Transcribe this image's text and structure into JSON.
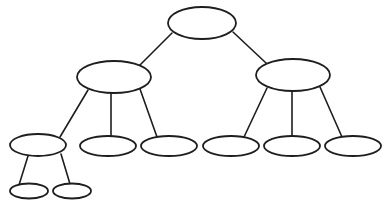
{
  "diagram": {
    "type": "tree",
    "title": "",
    "stroke_color": "#1e1e1e",
    "fill_color": "#ffffff",
    "background_color": "#ffffff",
    "nodes": [
      {
        "id": "root",
        "label": "",
        "cx": 202,
        "cy": 23,
        "rx": 34,
        "ry": 16,
        "level": 0
      },
      {
        "id": "l1-left",
        "label": "",
        "cx": 114,
        "cy": 77,
        "rx": 37,
        "ry": 16,
        "level": 1
      },
      {
        "id": "l1-right",
        "label": "",
        "cx": 293,
        "cy": 75,
        "rx": 37,
        "ry": 16,
        "level": 1
      },
      {
        "id": "l2-1",
        "label": "",
        "cx": 38,
        "cy": 145,
        "rx": 28,
        "ry": 11,
        "level": 2
      },
      {
        "id": "l2-2",
        "label": "",
        "cx": 108,
        "cy": 146,
        "rx": 28,
        "ry": 10,
        "level": 2
      },
      {
        "id": "l2-3",
        "label": "",
        "cx": 169,
        "cy": 146,
        "rx": 28,
        "ry": 10,
        "level": 2
      },
      {
        "id": "l2-4",
        "label": "",
        "cx": 231,
        "cy": 146,
        "rx": 28,
        "ry": 10,
        "level": 2
      },
      {
        "id": "l2-5",
        "label": "",
        "cx": 292,
        "cy": 146,
        "rx": 28,
        "ry": 10,
        "level": 2
      },
      {
        "id": "l2-6",
        "label": "",
        "cx": 353,
        "cy": 146,
        "rx": 28,
        "ry": 10,
        "level": 2
      },
      {
        "id": "l3-1",
        "label": "",
        "cx": 29,
        "cy": 191,
        "rx": 19,
        "ry": 7.5,
        "level": 3
      },
      {
        "id": "l3-2",
        "label": "",
        "cx": 72,
        "cy": 191,
        "rx": 19,
        "ry": 7.5,
        "level": 3
      }
    ],
    "edges": [
      {
        "from": "root",
        "to": "l1-left",
        "x1": 172,
        "y1": 33,
        "x2": 140,
        "y2": 65
      },
      {
        "from": "root",
        "to": "l1-right",
        "x1": 233,
        "y1": 32,
        "x2": 266,
        "y2": 63
      },
      {
        "from": "l1-left",
        "to": "l2-1",
        "x1": 88,
        "y1": 90,
        "x2": 60,
        "y2": 137
      },
      {
        "from": "l1-left",
        "to": "l2-2",
        "x1": 111,
        "y1": 93,
        "x2": 111,
        "y2": 136
      },
      {
        "from": "l1-left",
        "to": "l2-3",
        "x1": 140,
        "y1": 89,
        "x2": 157,
        "y2": 137
      },
      {
        "from": "l1-right",
        "to": "l2-4",
        "x1": 267,
        "y1": 88,
        "x2": 244,
        "y2": 137
      },
      {
        "from": "l1-right",
        "to": "l2-5",
        "x1": 292,
        "y1": 91,
        "x2": 292,
        "y2": 136
      },
      {
        "from": "l1-right",
        "to": "l2-6",
        "x1": 320,
        "y1": 87,
        "x2": 342,
        "y2": 137
      },
      {
        "from": "l2-1",
        "to": "l3-1",
        "x1": 28,
        "y1": 156,
        "x2": 19,
        "y2": 185
      },
      {
        "from": "l2-1",
        "to": "l3-2",
        "x1": 61,
        "y1": 154,
        "x2": 70,
        "y2": 184
      }
    ]
  }
}
